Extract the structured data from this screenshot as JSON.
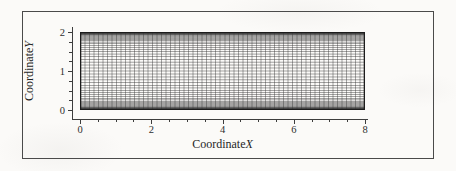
{
  "figure": {
    "frame_color": "#4a4a4a",
    "background_color": "#fbfaf8",
    "mesh_line_color": "#3a3a3a"
  },
  "axes": {
    "x_title_prefix": "Coordinate",
    "x_title_variable": "X",
    "y_title_prefix": "Coordinate",
    "y_title_variable": "Y",
    "x_tick_labels": [
      "0",
      "2",
      "4",
      "6",
      "8"
    ],
    "y_tick_labels": [
      "0",
      "1",
      "2"
    ]
  },
  "chart_data": {
    "type": "line",
    "title": "",
    "subtitle": "",
    "xlabel": "Coordinate X",
    "ylabel": "Coordinate Y",
    "xlim": [
      0,
      8
    ],
    "ylim": [
      0,
      2
    ],
    "x_ticks": [
      0,
      2,
      4,
      6,
      8
    ],
    "y_ticks": [
      0,
      1,
      2
    ],
    "x_minor_tick_interval": 0.5,
    "y_minor_tick_interval": 0.25,
    "grid": false,
    "legend": null,
    "annotations": [],
    "mesh": {
      "domain_x": [
        0,
        8
      ],
      "domain_y": [
        0,
        2
      ],
      "n_vertical_lines": 64,
      "n_horizontal_lines": 49,
      "x_distribution": "uniform",
      "y_distribution": "symmetric-two-sided-wall-clustering",
      "y_clustering_beta": 1.06,
      "line_color": "#3a3a3a",
      "line_width": 0.45
    },
    "series": [
      {
        "name": "vertical mesh lines",
        "orientation": "vertical",
        "count": 64,
        "spacing": "uniform",
        "x_start": 0,
        "x_end": 8
      },
      {
        "name": "horizontal mesh lines",
        "orientation": "horizontal",
        "count": 49,
        "spacing": "wall-clustered",
        "y_start": 0,
        "y_end": 2
      }
    ]
  }
}
